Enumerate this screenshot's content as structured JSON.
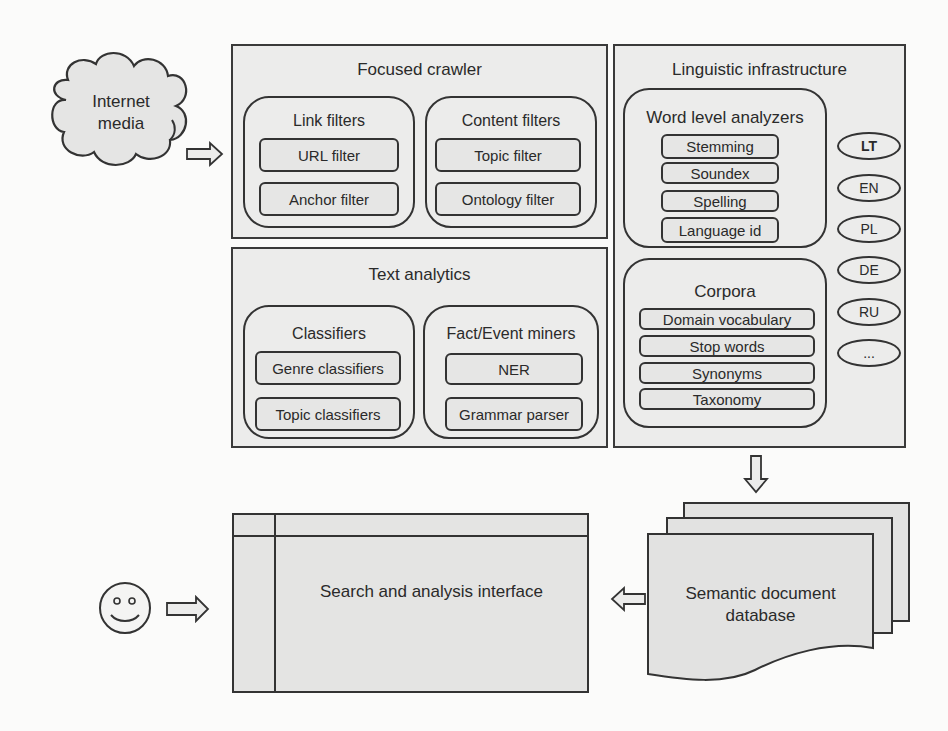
{
  "source": {
    "label_line1": "Internet",
    "label_line2": "media"
  },
  "focused_crawler": {
    "title": "Focused crawler",
    "link_filters": {
      "title": "Link filters",
      "items": [
        "URL filter",
        "Anchor filter"
      ]
    },
    "content_filters": {
      "title": "Content filters",
      "items": [
        "Topic filter",
        "Ontology filter"
      ]
    }
  },
  "text_analytics": {
    "title": "Text analytics",
    "classifiers": {
      "title": "Classifiers",
      "items": [
        "Genre classifiers",
        "Topic classifiers"
      ]
    },
    "miners": {
      "title": "Fact/Event miners",
      "items": [
        "NER",
        "Grammar parser"
      ]
    }
  },
  "linguistic_infrastructure": {
    "title": "Linguistic infrastructure",
    "word_level": {
      "title": "Word level analyzers",
      "items": [
        "Stemming",
        "Soundex",
        "Spelling",
        "Language id"
      ]
    },
    "corpora": {
      "title": "Corpora",
      "items": [
        "Domain vocabulary",
        "Stop words",
        "Synonyms",
        "Taxonomy"
      ]
    },
    "languages": [
      "LT",
      "EN",
      "PL",
      "DE",
      "RU",
      "..."
    ]
  },
  "database": {
    "label_line1": "Semantic document",
    "label_line2": "database"
  },
  "interface": {
    "label": "Search and analysis interface"
  },
  "user": {
    "icon": "smiley-face-icon"
  },
  "colors": {
    "panel_fill": "#ececeb",
    "stroke": "#333333",
    "background": "#fbfbfa"
  }
}
